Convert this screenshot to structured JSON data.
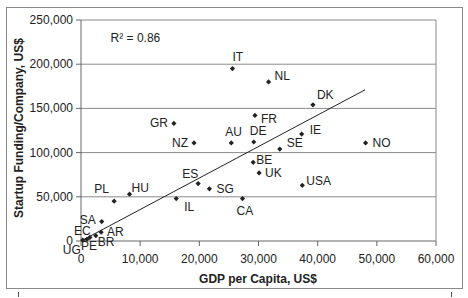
{
  "chart_data": {
    "type": "scatter",
    "title": "",
    "xlabel": "GDP per Capita, US$",
    "ylabel": "Startup Funding/Company, US$",
    "xlim": [
      0,
      60000
    ],
    "ylim": [
      0,
      250000
    ],
    "x_ticks": [
      0,
      10000,
      20000,
      30000,
      40000,
      50000,
      60000
    ],
    "x_tick_labels": [
      "0",
      "10,000",
      "20,000",
      "30,000",
      "40,000",
      "50,000",
      "60,000"
    ],
    "y_ticks": [
      0,
      50000,
      100000,
      150000,
      200000,
      250000
    ],
    "y_tick_labels": [
      "0",
      "50,000",
      "100,000",
      "150,000",
      "200,000",
      "250,000"
    ],
    "grid": {
      "horizontal": true,
      "vertical": false
    },
    "legend": null,
    "annotations": [
      {
        "text": "R² = 0.86",
        "x": 5000,
        "y": 230000
      }
    ],
    "trendline": {
      "type": "linear",
      "from": [
        0,
        0
      ],
      "to": [
        48000,
        171000
      ],
      "r_squared": 0.86
    },
    "points": [
      {
        "label": "IT",
        "x": 25600,
        "y": 195000,
        "lx": 0,
        "ly": -8,
        "anchor": "start"
      },
      {
        "label": "NL",
        "x": 31700,
        "y": 180000,
        "lx": 6,
        "ly": -2,
        "anchor": "start"
      },
      {
        "label": "DK",
        "x": 39200,
        "y": 154000,
        "lx": 4,
        "ly": -6,
        "anchor": "start"
      },
      {
        "label": "FR",
        "x": 29400,
        "y": 142000,
        "lx": 6,
        "ly": 8,
        "anchor": "start"
      },
      {
        "label": "GR",
        "x": 15700,
        "y": 133000,
        "lx": -6,
        "ly": 4,
        "anchor": "end"
      },
      {
        "label": "IE",
        "x": 37300,
        "y": 121000,
        "lx": 8,
        "ly": 0,
        "anchor": "start"
      },
      {
        "label": "DE",
        "x": 29200,
        "y": 112000,
        "lx": -4,
        "ly": -7,
        "anchor": "start"
      },
      {
        "label": "AU",
        "x": 25400,
        "y": 111000,
        "lx": -6,
        "ly": -7,
        "anchor": "start"
      },
      {
        "label": "NZ",
        "x": 19100,
        "y": 111000,
        "lx": -6,
        "ly": 4,
        "anchor": "end"
      },
      {
        "label": "NO",
        "x": 48100,
        "y": 111000,
        "lx": 7,
        "ly": 4,
        "anchor": "start"
      },
      {
        "label": "SE",
        "x": 33600,
        "y": 104000,
        "lx": 7,
        "ly": -2,
        "anchor": "start"
      },
      {
        "label": "BE",
        "x": 29100,
        "y": 89000,
        "lx": 3,
        "ly": 2,
        "anchor": "start"
      },
      {
        "label": "UK",
        "x": 30100,
        "y": 77000,
        "lx": 6,
        "ly": 4,
        "anchor": "start"
      },
      {
        "label": "ES",
        "x": 19800,
        "y": 65000,
        "lx": -16,
        "ly": -6,
        "anchor": "start"
      },
      {
        "label": "USA",
        "x": 37400,
        "y": 63000,
        "lx": 4,
        "ly": 0,
        "anchor": "start"
      },
      {
        "label": "SG",
        "x": 21700,
        "y": 59000,
        "lx": 7,
        "ly": 4,
        "anchor": "start"
      },
      {
        "label": "HU",
        "x": 8200,
        "y": 53000,
        "lx": 2,
        "ly": -2,
        "anchor": "start"
      },
      {
        "label": "IL",
        "x": 16100,
        "y": 48000,
        "lx": 8,
        "ly": 12,
        "anchor": "start"
      },
      {
        "label": "CA",
        "x": 27300,
        "y": 48000,
        "lx": -6,
        "ly": 16,
        "anchor": "start"
      },
      {
        "label": "PL",
        "x": 5600,
        "y": 45000,
        "lx": -20,
        "ly": -8,
        "anchor": "start"
      },
      {
        "label": "SA",
        "x": 3500,
        "y": 22000,
        "lx": -22,
        "ly": 2,
        "anchor": "start"
      },
      {
        "label": "AR",
        "x": 3400,
        "y": 10000,
        "lx": 6,
        "ly": 4,
        "anchor": "start"
      },
      {
        "label": "EC",
        "x": 1500,
        "y": 4000,
        "lx": -16,
        "ly": -2,
        "anchor": "start"
      },
      {
        "label": "BR",
        "x": 2500,
        "y": 6000,
        "lx": 2,
        "ly": 10,
        "anchor": "start"
      },
      {
        "label": "PE",
        "x": 1000,
        "y": 2000,
        "lx": -6,
        "ly": 11,
        "anchor": "start"
      },
      {
        "label": "UG",
        "x": 300,
        "y": 1000,
        "lx": -20,
        "ly": 14,
        "anchor": "start"
      }
    ]
  },
  "plot_box": {
    "left": 81,
    "right": 436,
    "top": 20,
    "bottom": 241
  },
  "colors": {
    "marker": "#222222",
    "gridline": "#8a8a8a",
    "axis": "#666666",
    "trendline": "#222222",
    "frame": "#8a8a8a"
  }
}
